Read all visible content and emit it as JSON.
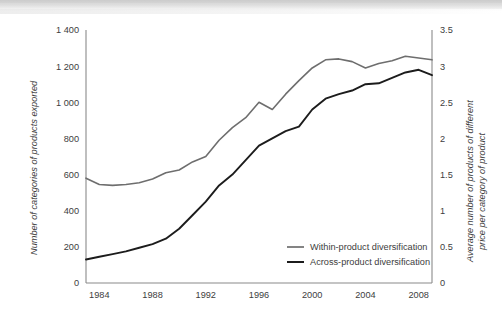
{
  "chart_data": {
    "type": "line",
    "title": "",
    "xlabel": "",
    "ylabel": "Number of categories of products exported",
    "y2label_line1": "Average number of products of different",
    "y2label_line2": "price per category of product",
    "grid": false,
    "legend_position": "inside-bottom-right",
    "x": [
      1983,
      1984,
      1985,
      1986,
      1987,
      1988,
      1989,
      1990,
      1991,
      1992,
      1993,
      1994,
      1995,
      1996,
      1997,
      1998,
      1999,
      2000,
      2001,
      2002,
      2003,
      2004,
      2005,
      2006,
      2007,
      2008,
      2009
    ],
    "xlim": [
      1983,
      2009
    ],
    "ylim": [
      0,
      1400
    ],
    "y2lim": [
      0,
      3.5
    ],
    "xticks": [
      "1984",
      "1988",
      "1992",
      "1996",
      "2000",
      "2004",
      "2008"
    ],
    "xtick_values": [
      1984,
      1988,
      1992,
      1996,
      2000,
      2004,
      2008
    ],
    "yticks": [
      "0",
      "200",
      "400",
      "600",
      "800",
      "1 000",
      "1 200",
      "1 400"
    ],
    "ytick_values": [
      0,
      200,
      400,
      600,
      800,
      1000,
      1200,
      1400
    ],
    "y2ticks": [
      "0",
      "0.5",
      "1",
      "1.5",
      "2",
      "2.5",
      "3",
      "3.5"
    ],
    "y2tick_values": [
      0,
      0.5,
      1,
      1.5,
      2,
      2.5,
      3,
      3.5
    ],
    "series": [
      {
        "name": "Within-product diversification",
        "axis": "left",
        "color": "#6e6e6e",
        "values": [
          580,
          545,
          540,
          545,
          555,
          575,
          610,
          625,
          670,
          700,
          790,
          860,
          915,
          1000,
          960,
          1045,
          1120,
          1190,
          1235,
          1240,
          1225,
          1190,
          1215,
          1230,
          1255,
          1245,
          1235
        ]
      },
      {
        "name": "Across-product diversification",
        "axis": "right",
        "color": "#1c1c1c",
        "values": [
          130,
          145,
          160,
          175,
          195,
          215,
          245,
          300,
          375,
          450,
          540,
          600,
          680,
          760,
          800,
          840,
          865,
          960,
          1020,
          1045,
          1065,
          1100,
          1105,
          1135,
          1165,
          1180,
          1150
        ]
      }
    ],
    "legend": [
      {
        "label": "Within-product diversification",
        "color": "#6e6e6e"
      },
      {
        "label": "Across-product diversification",
        "color": "#1c1c1c"
      }
    ]
  }
}
